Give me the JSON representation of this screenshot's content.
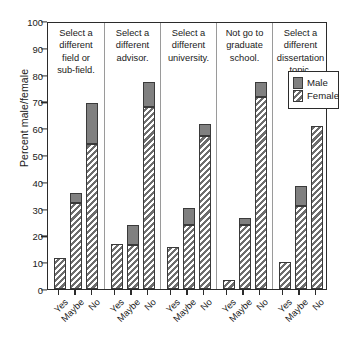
{
  "chart_data": {
    "type": "bar",
    "title": "",
    "subtitle": "",
    "xlabel": "",
    "ylabel": "Percent male/female",
    "ylim": [
      0,
      100
    ],
    "ytick_values": [
      0,
      10,
      20,
      30,
      40,
      50,
      60,
      70,
      80,
      90,
      100
    ],
    "ytick_labels": [
      "0",
      "10",
      "20",
      "30",
      "40",
      "50",
      "60",
      "70",
      "80",
      "90",
      "100"
    ],
    "grid": false,
    "stacked": true,
    "legend_position": "top-right-inside",
    "legend": [
      {
        "name": "Male",
        "style": "solid-gray",
        "color": "#808080"
      },
      {
        "name": "Female",
        "style": "diagonal-hatch",
        "color": "#6d6d6d"
      }
    ],
    "categories": [
      "Yes",
      "Maybe",
      "No"
    ],
    "panels": [
      {
        "title": "Select a different field or sub-field.",
        "title_lines": [
          "Select a",
          "different",
          "field or",
          "sub-field."
        ],
        "bars": [
          {
            "category": "Yes",
            "female": 11.5,
            "male": 0.0,
            "total": 11.5
          },
          {
            "category": "Maybe",
            "female": 32.0,
            "male": 4.0,
            "total": 36.0
          },
          {
            "category": "No",
            "female": 54.0,
            "male": 15.5,
            "total": 69.5
          }
        ]
      },
      {
        "title": "Select a different advisor.",
        "title_lines": [
          "Select a",
          "different",
          "advisor."
        ],
        "bars": [
          {
            "category": "Yes",
            "female": 16.8,
            "male": 0.0,
            "total": 16.8
          },
          {
            "category": "Maybe",
            "female": 16.5,
            "male": 7.3,
            "total": 23.8
          },
          {
            "category": "No",
            "female": 68.0,
            "male": 9.2,
            "total": 77.2
          }
        ]
      },
      {
        "title": "Select a different university.",
        "title_lines": [
          "Select a",
          "different",
          "university."
        ],
        "bars": [
          {
            "category": "Yes",
            "female": 15.6,
            "male": 0.0,
            "total": 15.6
          },
          {
            "category": "Maybe",
            "female": 24.0,
            "male": 6.2,
            "total": 30.2
          },
          {
            "category": "No",
            "female": 57.0,
            "male": 4.6,
            "total": 61.6
          }
        ]
      },
      {
        "title": "Not go to graduate school.",
        "title_lines": [
          "Not go to",
          "graduate",
          "school."
        ],
        "bars": [
          {
            "category": "Yes",
            "female": 3.5,
            "male": 0.0,
            "total": 3.5
          },
          {
            "category": "Maybe",
            "female": 24.0,
            "male": 2.6,
            "total": 26.6
          },
          {
            "category": "No",
            "female": 71.5,
            "male": 5.7,
            "total": 77.2
          }
        ]
      },
      {
        "title": "Select a different dissertation topic.",
        "title_lines": [
          "Select a",
          "different",
          "dissertation",
          "topic."
        ],
        "bars": [
          {
            "category": "Yes",
            "female": 10.0,
            "male": 0.0,
            "total": 10.0
          },
          {
            "category": "Maybe",
            "female": 31.0,
            "male": 7.6,
            "total": 38.6
          },
          {
            "category": "No",
            "female": 61.0,
            "male": 0.0,
            "total": 61.0
          }
        ]
      }
    ]
  }
}
